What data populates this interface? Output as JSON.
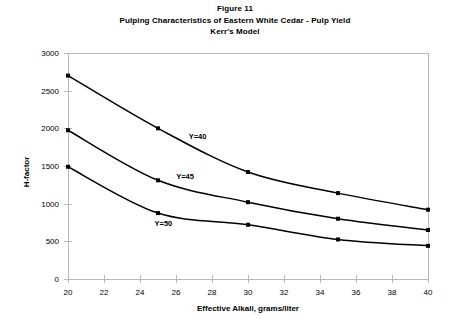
{
  "title": {
    "line1": "Figure 11",
    "line2": "Pulping Characteristics of Eastern White Cedar - Pulp Yield",
    "line3": "Kerr's Model"
  },
  "chart_data": {
    "type": "line",
    "title": "Pulping Characteristics of Eastern White Cedar - Pulp Yield",
    "subtitle": "Kerr's Model",
    "figure_label": "Figure 11",
    "xlabel": "Effective Alkali, grams/liter",
    "ylabel": "H-factor",
    "xlim": [
      20,
      40
    ],
    "ylim": [
      0,
      3000
    ],
    "xticks": [
      20,
      22,
      24,
      26,
      28,
      30,
      32,
      34,
      36,
      38,
      40
    ],
    "yticks": [
      0,
      500,
      1000,
      1500,
      2000,
      2500,
      3000
    ],
    "grid": false,
    "legend": "inline-annotations",
    "marker": "square",
    "line_color": "#000000",
    "x": [
      20,
      25,
      30,
      35,
      40
    ],
    "series": [
      {
        "name": "Y=40",
        "label": "Y=40",
        "values": [
          2700,
          2000,
          1420,
          1140,
          920
        ],
        "label_x": 27.2,
        "label_y": 1860
      },
      {
        "name": "Y=45",
        "label": "Y=45",
        "values": [
          1975,
          1310,
          1020,
          800,
          650
        ],
        "label_x": 26.5,
        "label_y": 1330
      },
      {
        "name": "Y=50",
        "label": "Y=50",
        "values": [
          1490,
          875,
          720,
          525,
          440
        ],
        "label_x": 25.3,
        "label_y": 700
      }
    ]
  }
}
